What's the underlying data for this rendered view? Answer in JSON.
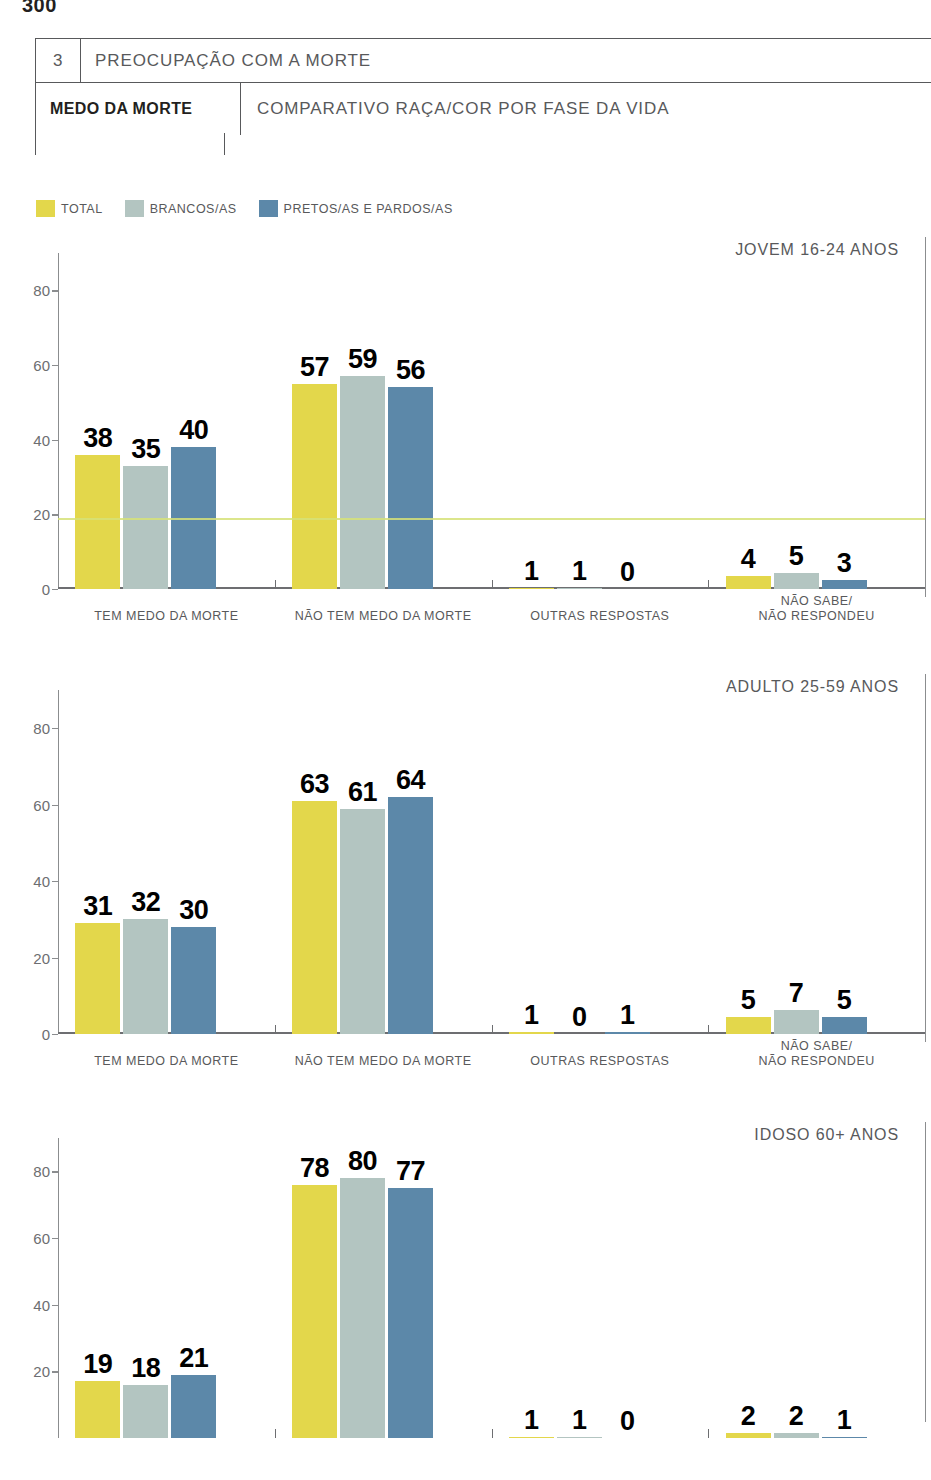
{
  "page": {
    "number": "300"
  },
  "header": {
    "section_number": "3",
    "section_title": "PREOCUPAÇÃO COM A MORTE",
    "topic": "MEDO DA MORTE",
    "subtitle": "COMPARATIVO RAÇA/COR POR FASE DA VIDA"
  },
  "legend": {
    "items": [
      {
        "label": "TOTAL",
        "color": "#e3d74b"
      },
      {
        "label": "BRANCOS/AS",
        "color": "#b3c5c1"
      },
      {
        "label": "PRETOS/AS E PARDOS/AS",
        "color": "#5c88a9"
      }
    ]
  },
  "colors": {
    "total": "#e3d74b",
    "brancos": "#b3c5c1",
    "pretos_pardos": "#5c88a9",
    "axis": "#8b8d8f",
    "label_text": "#58595b",
    "value_text": "#000000"
  },
  "chart_data": [
    {
      "type": "bar",
      "title": "JOVEM 16-24 ANOS",
      "xlabel": "",
      "ylabel": "",
      "ylim": [
        0,
        90
      ],
      "yticks": [
        0,
        20,
        40,
        60,
        80
      ],
      "grid": false,
      "legend_position": "top-left",
      "categories": [
        "TEM MEDO DA MORTE",
        "NÃO TEM MEDO DA MORTE",
        "OUTRAS RESPOSTAS",
        "NÃO SABE/\nNÃO RESPONDEU"
      ],
      "series": [
        {
          "name": "TOTAL",
          "values": [
            38,
            57,
            1,
            4
          ]
        },
        {
          "name": "BRANCOS/AS",
          "values": [
            35,
            59,
            1,
            5
          ]
        },
        {
          "name": "PRETOS/AS E PARDOS/AS",
          "values": [
            40,
            56,
            0,
            3
          ]
        }
      ]
    },
    {
      "type": "bar",
      "title": "ADULTO 25-59 ANOS",
      "xlabel": "",
      "ylabel": "",
      "ylim": [
        0,
        90
      ],
      "yticks": [
        0,
        20,
        40,
        60,
        80
      ],
      "grid": false,
      "legend_position": "top-left",
      "categories": [
        "TEM MEDO DA MORTE",
        "NÃO TEM MEDO DA MORTE",
        "OUTRAS RESPOSTAS",
        "NÃO SABE/\nNÃO RESPONDEU"
      ],
      "series": [
        {
          "name": "TOTAL",
          "values": [
            31,
            63,
            1,
            5
          ]
        },
        {
          "name": "BRANCOS/AS",
          "values": [
            32,
            61,
            0,
            7
          ]
        },
        {
          "name": "PRETOS/AS E PARDOS/AS",
          "values": [
            30,
            64,
            1,
            5
          ]
        }
      ]
    },
    {
      "type": "bar",
      "title": "IDOSO 60+ ANOS",
      "xlabel": "",
      "ylabel": "",
      "ylim": [
        0,
        90
      ],
      "yticks": [
        20,
        40,
        60,
        80
      ],
      "grid": false,
      "legend_position": "top-left",
      "truncated": "bottom edge of page — baseline and category labels not visible",
      "categories": [
        "TEM MEDO DA MORTE",
        "NÃO TEM MEDO DA MORTE",
        "OUTRAS RESPOSTAS",
        "NÃO SABE/\nNÃO RESPONDEU"
      ],
      "series": [
        {
          "name": "TOTAL",
          "values": [
            19,
            78,
            1,
            2
          ]
        },
        {
          "name": "BRANCOS/AS",
          "values": [
            18,
            80,
            1,
            2
          ]
        },
        {
          "name": "PRETOS/AS E PARDOS/AS",
          "values": [
            21,
            77,
            0,
            1
          ]
        }
      ]
    }
  ]
}
